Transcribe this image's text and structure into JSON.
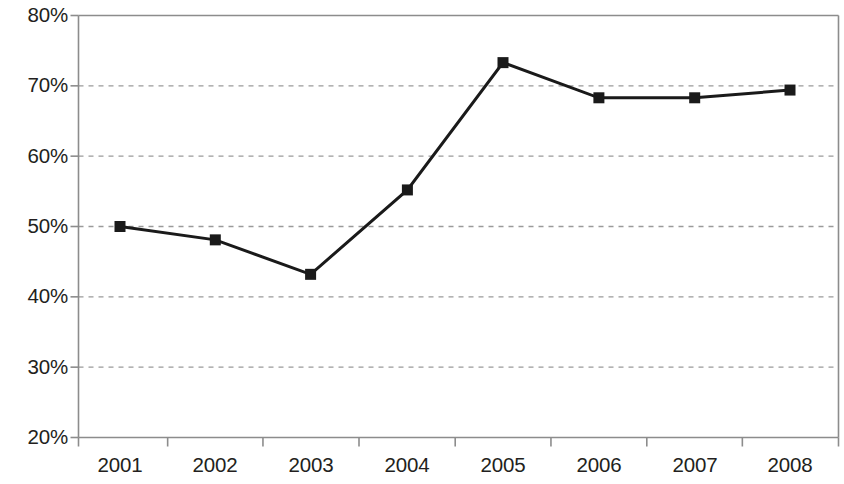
{
  "chart_data": {
    "type": "line",
    "title": "",
    "subtitle": "",
    "xlabel": "",
    "ylabel": "",
    "categories": [
      "2001",
      "2002",
      "2003",
      "2004",
      "2005",
      "2006",
      "2007",
      "2008"
    ],
    "x": [
      2001,
      2002,
      2003,
      2004,
      2005,
      2006,
      2007,
      2008
    ],
    "values": [
      50.0,
      48.1,
      43.2,
      55.2,
      73.3,
      68.3,
      68.3,
      69.4
    ],
    "value_suffix": "%",
    "ylim": [
      20,
      80
    ],
    "yticks": [
      20,
      30,
      40,
      50,
      60,
      70,
      80
    ],
    "ytick_labels": [
      "20%",
      "30%",
      "40%",
      "50%",
      "60%",
      "70%",
      "80%"
    ],
    "xtick_labels": [
      "2001",
      "2002",
      "2003",
      "2004",
      "2005",
      "2006",
      "2007",
      "2008"
    ],
    "grid": {
      "horizontal": true,
      "vertical": false,
      "style": "dashed",
      "color": "#9a9a9a",
      "at": [
        30,
        40,
        50,
        60,
        70
      ]
    },
    "legend": {
      "show": false,
      "position": "none",
      "entries": []
    },
    "series": [
      {
        "name": "",
        "color": "#1a1a1a",
        "marker": "square",
        "marker_size": 11,
        "line_width": 3,
        "values": [
          50.0,
          48.1,
          43.2,
          55.2,
          73.3,
          68.3,
          68.3,
          69.4
        ]
      }
    ],
    "annotations": [],
    "axis_color": "#8c8c8c",
    "plot_border": [
      "top",
      "right",
      "left",
      "bottom"
    ],
    "background": "#ffffff"
  }
}
